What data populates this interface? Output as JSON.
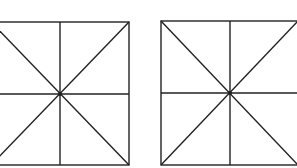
{
  "figure": {
    "stroke_color": "#222222",
    "background": "#ffffff",
    "squares": [
      {
        "x1": -9,
        "y1": 22,
        "x2": 129,
        "y2": 165,
        "cx": 60,
        "cy": 94
      },
      {
        "x1": 161,
        "y1": 21,
        "x2": 298,
        "y2": 165,
        "cx": 230,
        "cy": 93
      }
    ]
  }
}
